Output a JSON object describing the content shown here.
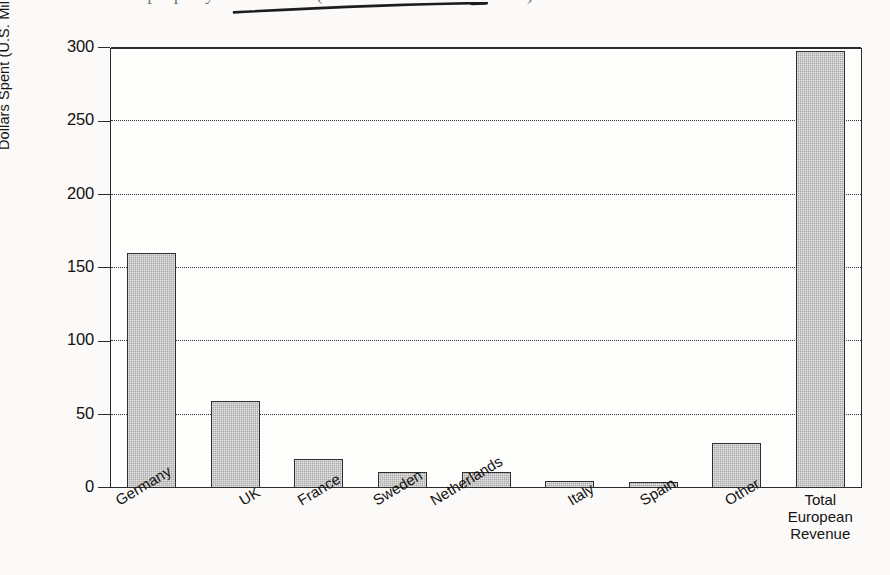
{
  "page": {
    "background_color": "#fbfaf8",
    "scan_artifact": {
      "cut_text": "of the property of the 1995 (revenue and market share) and",
      "stroke_icon": "handwritten-underline-stroke"
    }
  },
  "chart_data": {
    "type": "bar",
    "title": "",
    "xlabel": "",
    "ylabel": "Dollars Spent (U.S. Millions)",
    "categories": [
      "Germany",
      "UK",
      "France",
      "Sweden",
      "Netherlands",
      "Italy",
      "Spain",
      "Other",
      "Total European Revenue"
    ],
    "values": [
      160,
      59,
      20,
      11,
      11,
      5,
      4,
      31,
      298
    ],
    "ylim": [
      0,
      300
    ],
    "yticks": [
      0,
      50,
      100,
      150,
      200,
      250,
      300
    ],
    "ytick_labels": [
      "0",
      "50",
      "100",
      "150",
      "200",
      "250",
      "300"
    ],
    "grid": true,
    "grid_style": "dotted-horizontal",
    "legend": "none",
    "bar_fill_color": "#a9a9a9",
    "bar_edge_color": "#2e2e2e",
    "axis_color": "#2a2a2a"
  },
  "axis": {
    "y_title": "Dollars Spent (U.S. Millions)"
  }
}
